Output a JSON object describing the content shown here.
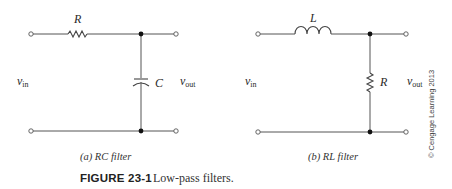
{
  "figure": {
    "number": "FIGURE 23-1",
    "title": "Low-pass filters.",
    "copyright": "© Cengage Learning 2013"
  },
  "circuits": [
    {
      "id": "rc",
      "caption": "(a) RC filter",
      "series_component": {
        "type": "resistor",
        "label": "R"
      },
      "shunt_component": {
        "type": "capacitor",
        "label": "C"
      },
      "input_label": {
        "base": "v",
        "sub": "in"
      },
      "output_label": {
        "base": "v",
        "sub": "out"
      }
    },
    {
      "id": "rl",
      "caption": "(b) RL filter",
      "series_component": {
        "type": "inductor",
        "label": "L"
      },
      "shunt_component": {
        "type": "resistor",
        "label": "R"
      },
      "input_label": {
        "base": "v",
        "sub": "in"
      },
      "output_label": {
        "base": "v",
        "sub": "out"
      }
    }
  ]
}
